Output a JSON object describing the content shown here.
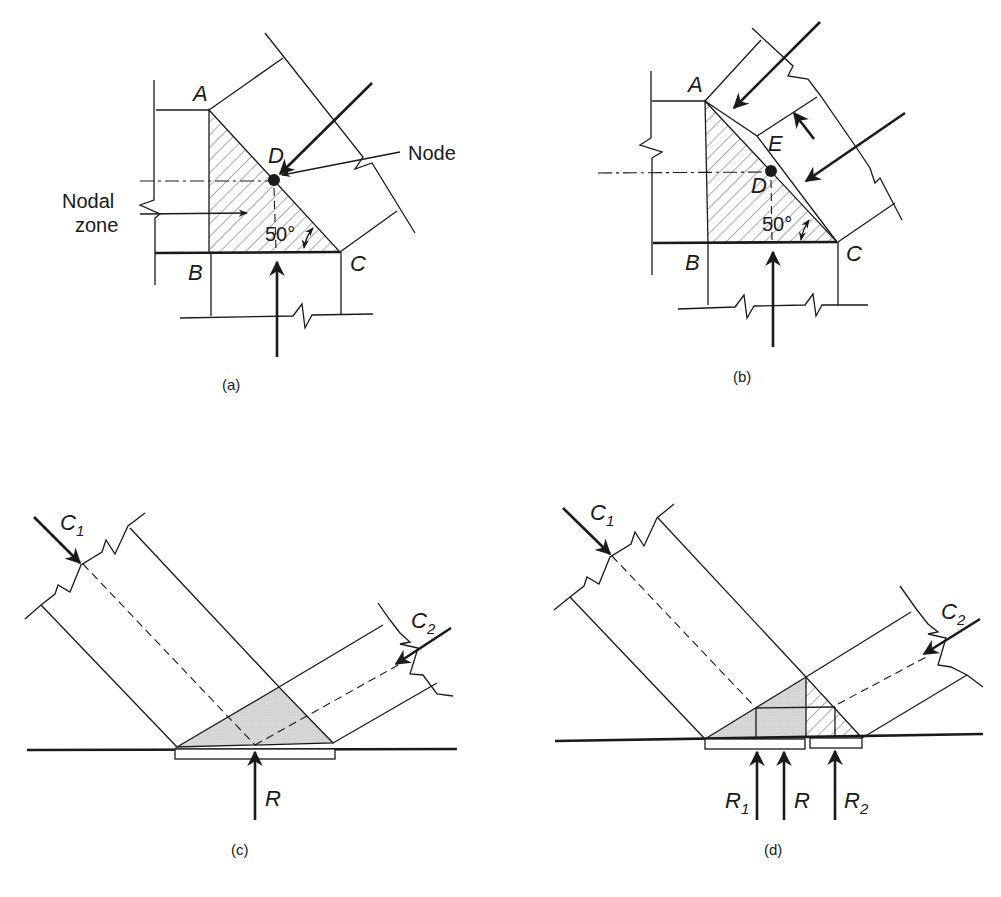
{
  "figure": {
    "panels": [
      {
        "id": "a",
        "caption": "(a)",
        "labels": {
          "A": "A",
          "B": "B",
          "C": "C",
          "D": "D"
        },
        "node_label": "Node",
        "nodal_zone_label_line1": "Nodal",
        "nodal_zone_label_line2": "zone",
        "angle": "50°"
      },
      {
        "id": "b",
        "caption": "(b)",
        "labels": {
          "A": "A",
          "B": "B",
          "C": "C",
          "D": "D",
          "E": "E"
        },
        "angle": "50°"
      },
      {
        "id": "c",
        "caption": "(c)",
        "labels": {
          "C1": "C",
          "C1_sub": "1",
          "C2": "C",
          "C2_sub": "2",
          "R": "R"
        }
      },
      {
        "id": "d",
        "caption": "(d)",
        "labels": {
          "C1": "C",
          "C1_sub": "1",
          "C2": "C",
          "C2_sub": "2",
          "R": "R",
          "R1": "R",
          "R1_sub": "1",
          "R2": "R",
          "R2_sub": "2"
        }
      }
    ],
    "colors": {
      "ink": "#1a1a1a",
      "shade": "#d6d6d6",
      "background": "#ffffff"
    }
  }
}
